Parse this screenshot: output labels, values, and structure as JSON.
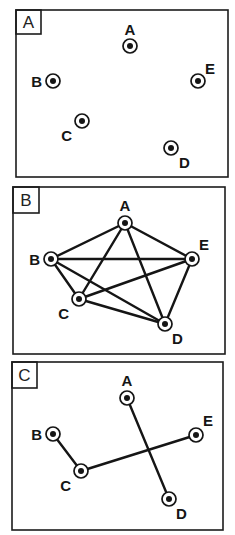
{
  "panels": [
    {
      "label": "A",
      "box": {
        "x": 16,
        "y": 10,
        "w": 212,
        "h": 167
      },
      "tag": {
        "w": 25,
        "h": 24
      },
      "nodes": [
        {
          "id": "A",
          "x": 130,
          "y": 46,
          "lx": 130,
          "ly": 35,
          "anchor": "middle"
        },
        {
          "id": "B",
          "x": 53,
          "y": 81,
          "lx": 42,
          "ly": 87,
          "anchor": "end"
        },
        {
          "id": "C",
          "x": 82,
          "y": 121,
          "lx": 72,
          "ly": 141,
          "anchor": "end"
        },
        {
          "id": "D",
          "x": 171,
          "y": 148,
          "lx": 179,
          "ly": 168,
          "anchor": "start"
        },
        {
          "id": "E",
          "x": 198,
          "y": 81,
          "lx": 205,
          "ly": 74,
          "anchor": "start"
        }
      ],
      "edges": []
    },
    {
      "label": "B",
      "box": {
        "x": 13,
        "y": 187,
        "w": 212,
        "h": 167
      },
      "tag": {
        "w": 26,
        "h": 26
      },
      "nodes": [
        {
          "id": "A",
          "x": 125,
          "y": 223,
          "lx": 125,
          "ly": 211,
          "anchor": "middle"
        },
        {
          "id": "B",
          "x": 51,
          "y": 259,
          "lx": 40,
          "ly": 265,
          "anchor": "end"
        },
        {
          "id": "C",
          "x": 79,
          "y": 299,
          "lx": 69,
          "ly": 319,
          "anchor": "end"
        },
        {
          "id": "D",
          "x": 165,
          "y": 324,
          "lx": 172,
          "ly": 344,
          "anchor": "start"
        },
        {
          "id": "E",
          "x": 192,
          "y": 259,
          "lx": 199,
          "ly": 250,
          "anchor": "start"
        }
      ],
      "edges": [
        [
          "A",
          "B"
        ],
        [
          "A",
          "C"
        ],
        [
          "A",
          "D"
        ],
        [
          "A",
          "E"
        ],
        [
          "B",
          "C"
        ],
        [
          "B",
          "D"
        ],
        [
          "B",
          "E"
        ],
        [
          "C",
          "D"
        ],
        [
          "C",
          "E"
        ],
        [
          "D",
          "E"
        ]
      ]
    },
    {
      "label": "C",
      "box": {
        "x": 12,
        "y": 362,
        "w": 211,
        "h": 168
      },
      "tag": {
        "w": 25,
        "h": 26
      },
      "nodes": [
        {
          "id": "A",
          "x": 127,
          "y": 398,
          "lx": 127,
          "ly": 386,
          "anchor": "middle"
        },
        {
          "id": "B",
          "x": 53,
          "y": 434,
          "lx": 42,
          "ly": 440,
          "anchor": "end"
        },
        {
          "id": "C",
          "x": 81,
          "y": 471,
          "lx": 71,
          "ly": 491,
          "anchor": "end"
        },
        {
          "id": "D",
          "x": 169,
          "y": 499,
          "lx": 176,
          "ly": 519,
          "anchor": "start"
        },
        {
          "id": "E",
          "x": 196,
          "y": 435,
          "lx": 203,
          "ly": 426,
          "anchor": "start"
        }
      ],
      "edges": [
        [
          "B",
          "C"
        ],
        [
          "C",
          "E"
        ],
        [
          "A",
          "D"
        ]
      ]
    }
  ],
  "style": {
    "ink": "#151515",
    "background": "#ffffff"
  }
}
